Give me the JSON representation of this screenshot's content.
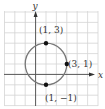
{
  "figure": {
    "type": "circle-graph",
    "axes": {
      "x_label": "x",
      "y_label": "y"
    },
    "grid": {
      "x_min": -3,
      "x_max": 6,
      "y_min": -3,
      "y_max": 6
    },
    "circle": {
      "center": [
        1,
        1
      ],
      "radius": 2,
      "color": "#777777"
    },
    "points": [
      {
        "x": 1,
        "y": 3,
        "label": "(1, 3)"
      },
      {
        "x": 3,
        "y": 1,
        "label": "(3, 1)"
      },
      {
        "x": 1,
        "y": -1,
        "label": "(1, −1)"
      }
    ]
  }
}
